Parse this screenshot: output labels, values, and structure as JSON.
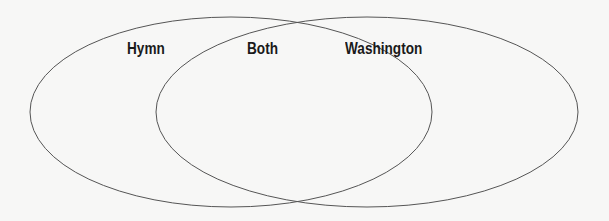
{
  "diagram": {
    "type": "venn",
    "labels": {
      "left": "Hymn",
      "middle": "Both",
      "right": "Washington"
    },
    "stroke_color": "#555555",
    "background": "#f7f7f6"
  }
}
